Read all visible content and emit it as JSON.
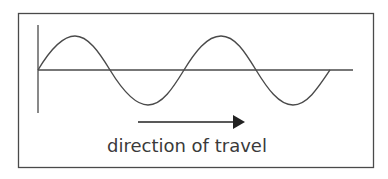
{
  "diagram": {
    "caption": "direction of travel",
    "colors": {
      "stroke": "#4a4a4a",
      "arrow": "#222222",
      "text": "#3a3a3a",
      "background": "#ffffff"
    },
    "elements": [
      "frame",
      "vertical-axis",
      "horizontal-axis",
      "transverse-wave",
      "direction-arrow",
      "caption"
    ],
    "wave": {
      "cycles": 2,
      "description": "sine wave starting at origin, two full wavelengths"
    }
  }
}
